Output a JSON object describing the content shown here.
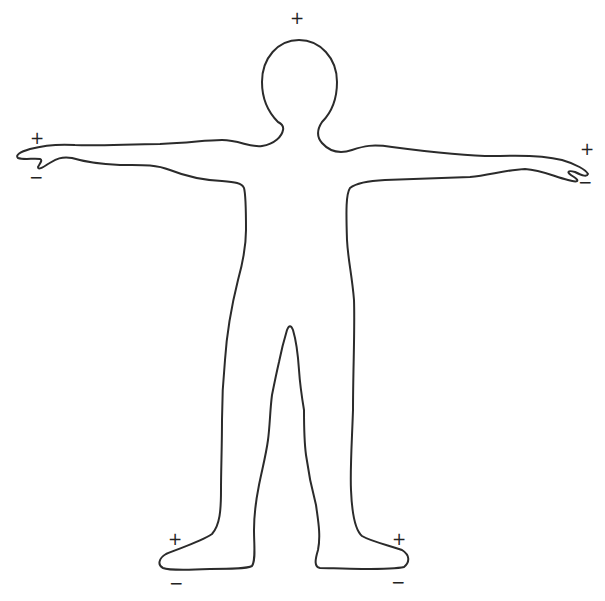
{
  "figure": {
    "stroke_color": "#2b2b2b",
    "background": "#ffffff"
  },
  "markers": [
    {
      "id": "head-plus",
      "symbol": "+",
      "x": 297,
      "y": 18
    },
    {
      "id": "left-hand-plus",
      "symbol": "+",
      "x": 37,
      "y": 138
    },
    {
      "id": "left-hand-minus",
      "symbol": "−",
      "x": 36,
      "y": 177
    },
    {
      "id": "right-hand-plus",
      "symbol": "+",
      "x": 587,
      "y": 149
    },
    {
      "id": "right-hand-minus",
      "symbol": "−",
      "x": 585,
      "y": 182
    },
    {
      "id": "left-foot-plus",
      "symbol": "+",
      "x": 175,
      "y": 539
    },
    {
      "id": "left-foot-minus",
      "symbol": "−",
      "x": 176,
      "y": 583
    },
    {
      "id": "right-foot-plus",
      "symbol": "+",
      "x": 399,
      "y": 539
    },
    {
      "id": "right-foot-minus",
      "symbol": "−",
      "x": 398,
      "y": 582
    }
  ]
}
